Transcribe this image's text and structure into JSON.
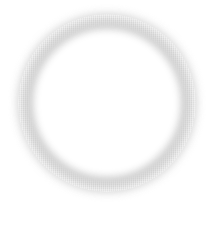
{
  "graphic": {
    "shape": "ring",
    "description": "soft blurred gray circular ring on white background",
    "colors": {
      "background": "#ffffff",
      "ring": "#c9c9c9",
      "inner": "#ffffff"
    },
    "geometry": {
      "center_x": 107,
      "center_y": 103,
      "outer_radius": 89,
      "inner_radius": 72
    }
  }
}
